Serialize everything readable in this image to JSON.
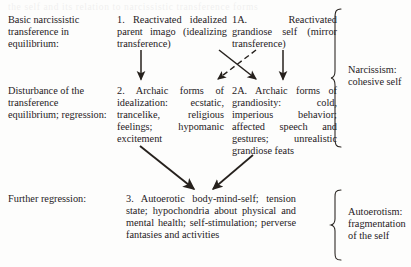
{
  "figure": {
    "ghost_text": "the self  and its  relation to  narcissistic  transference  forms",
    "rows": [
      {
        "id": "row-equilibrium",
        "label": "Basic narcissistic transference in equilibrium:",
        "cells": [
          {
            "id": "cell-1",
            "number": "1.",
            "text": "1. Reactivated idealized parent imago (idealizing transference)"
          },
          {
            "id": "cell-1a",
            "number": "1A.",
            "text": "1A. Reactivated grandiose self (mirror transference)"
          }
        ]
      },
      {
        "id": "row-disturbance",
        "label": "Disturbance of the transference equilibrium; regression:",
        "cells": [
          {
            "id": "cell-2",
            "number": "2.",
            "text": "2. Archaic forms of idealization: ecstatic, trancelike, religious feelings; hypomanic excitement"
          },
          {
            "id": "cell-2a",
            "number": "2A.",
            "text": "2A. Archaic forms of grandiosity: cold, imperious behavior; affected speech and gestures; unrealistic grandiose feats"
          }
        ]
      },
      {
        "id": "row-further",
        "label": "Further regression:",
        "cells": [
          {
            "id": "cell-3",
            "number": "3.",
            "text": "3. Autoerotic body-mind-self; tension state; hypochondria about physical and mental health; self-stimulation; perverse fantasies and activities"
          }
        ]
      }
    ],
    "braces": [
      {
        "id": "brace-narcissism",
        "label": "Narcissism: cohesive self"
      },
      {
        "id": "brace-autoerotism",
        "label": "Autoerotism: fragmentation of the self"
      }
    ],
    "arrows": [
      {
        "id": "arrow-1-to-2",
        "style": "solid",
        "from": "cell-1",
        "to": "cell-2"
      },
      {
        "id": "arrow-1a-to-2a",
        "style": "solid",
        "from": "cell-1a",
        "to": "cell-2a"
      },
      {
        "id": "arrow-1-to-2a",
        "style": "solid",
        "from": "cell-1",
        "to": "cell-2a"
      },
      {
        "id": "arrow-1a-to-2",
        "style": "dashed",
        "from": "cell-1a",
        "to": "cell-2"
      },
      {
        "id": "arrow-2-to-3",
        "style": "solid",
        "from": "cell-2",
        "to": "cell-3"
      },
      {
        "id": "arrow-2a-to-3",
        "style": "solid",
        "from": "cell-2a",
        "to": "cell-3"
      }
    ],
    "colors": {
      "ink": "#26211d",
      "paper": "#fdfdfc"
    }
  }
}
